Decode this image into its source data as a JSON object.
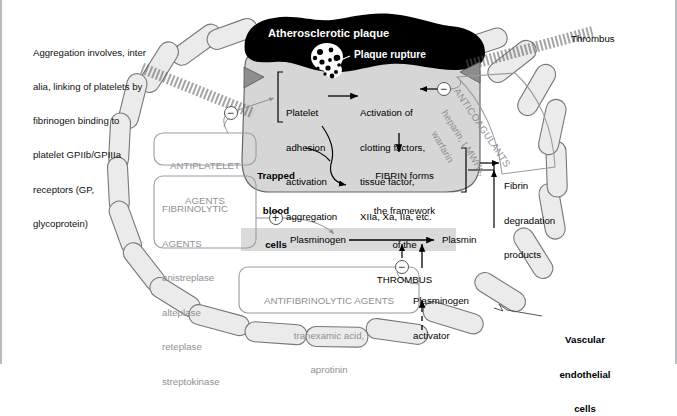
{
  "figure": {
    "type": "medical-pathway-diagram"
  },
  "annotations": {
    "aggregation_note": [
      "Aggregation involves, inter",
      "alia, linking of platelets by",
      "fibrinogen binding to",
      "platelet GPIIb/GPIIIa",
      "receptors (GP,",
      "glycoprotein)"
    ],
    "thrombus_label": "Thrombus",
    "vascular_cells_label": [
      "Vascular",
      "endothelial",
      "cells"
    ]
  },
  "plaque": {
    "title": "Atherosclerotic plaque",
    "rupture_label": "Plaque rupture"
  },
  "cascade": {
    "platelet": [
      "Platelet",
      "adhesion",
      "activation",
      "aggregation"
    ],
    "clotting": [
      "Activation of",
      "clotting factors,",
      "tissue factor,",
      "XIIa, Xa, IIa, etc."
    ],
    "trapped": [
      "Trapped",
      "blood",
      "cells"
    ],
    "fibrin": [
      "FIBRIN forms",
      "the framework",
      "of the",
      "THROMBUS"
    ],
    "fdp": [
      "Fibrin",
      "degradation",
      "products"
    ]
  },
  "fibrinolysis": {
    "plasminogen": "Plasminogen",
    "plasmin": "Plasmin",
    "activator": [
      "Plasminogen",
      "activator"
    ]
  },
  "drugs": {
    "antiplatelet": {
      "name": [
        "ANTIPLATELET",
        "AGENTS"
      ]
    },
    "fibrinolytic": {
      "name": [
        "FIBRINOLYTIC",
        "AGENTS"
      ],
      "items": [
        "anistreplase",
        "alteplase",
        "reteplase",
        "streptokinase"
      ]
    },
    "anticoagulants": {
      "name": "ANTICOAGULANTS",
      "line2": "heparin, LMWHs,",
      "line3": "warfarin"
    },
    "antifibrinolytic": {
      "name": "ANTIFIBRINOLYTIC AGENTS",
      "items": [
        "tranexamic acid,",
        "aprotinin"
      ]
    }
  },
  "signs": {
    "minus": "−",
    "plus": "+"
  },
  "colors": {
    "plaque": "#000000",
    "clot_fill": "#d6d6d6",
    "cell_fill": "#ebebeb",
    "band_fill": "#dadada",
    "drug_text": "#8e9095",
    "outline": "#555555",
    "page_border": "#b9bcc2"
  }
}
